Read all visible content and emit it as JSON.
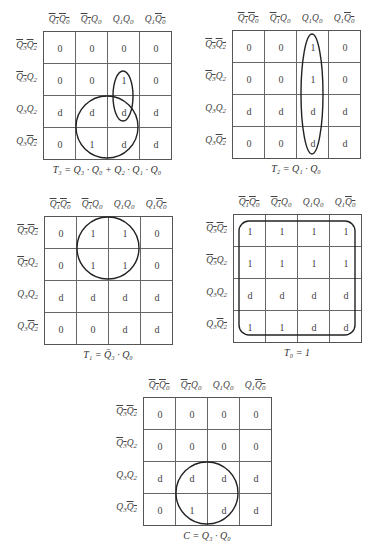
{
  "column_headers": [
    {
      "parts": [
        {
          "t": "Q",
          "sub": "1",
          "bar": true
        },
        {
          "t": "Q",
          "sub": "0",
          "bar": true
        }
      ]
    },
    {
      "parts": [
        {
          "t": "Q",
          "sub": "1",
          "bar": true
        },
        {
          "t": "Q",
          "sub": "0",
          "bar": false
        }
      ]
    },
    {
      "parts": [
        {
          "t": "Q",
          "sub": "1",
          "bar": false
        },
        {
          "t": "Q",
          "sub": "0",
          "bar": false
        }
      ]
    },
    {
      "parts": [
        {
          "t": "Q",
          "sub": "1",
          "bar": false
        },
        {
          "t": "Q",
          "sub": "0",
          "bar": true
        }
      ]
    }
  ],
  "row_headers": [
    {
      "parts": [
        {
          "t": "Q",
          "sub": "3",
          "bar": true
        },
        {
          "t": "Q",
          "sub": "2",
          "bar": true
        }
      ]
    },
    {
      "parts": [
        {
          "t": "Q",
          "sub": "3",
          "bar": true
        },
        {
          "t": "Q",
          "sub": "2",
          "bar": false
        }
      ]
    },
    {
      "parts": [
        {
          "t": "Q",
          "sub": "3",
          "bar": false
        },
        {
          "t": "Q",
          "sub": "2",
          "bar": false
        }
      ]
    },
    {
      "parts": [
        {
          "t": "Q",
          "sub": "3",
          "bar": false
        },
        {
          "t": "Q",
          "sub": "2",
          "bar": true
        }
      ]
    }
  ],
  "maps": [
    {
      "id": "T3",
      "caption": "T₃ = Q₃ · Q₀ + Q₂ · Q₁ · Q₀",
      "origin": [
        43,
        31
      ],
      "cells": [
        [
          "0",
          "0",
          "0",
          "0"
        ],
        [
          "0",
          "0",
          "1",
          "0"
        ],
        [
          "d",
          "d",
          "d",
          "d"
        ],
        [
          "0",
          "1",
          "d",
          "d"
        ]
      ],
      "groups": [
        {
          "shape": "ellipse",
          "cx": 80,
          "cy": 65,
          "rx": 10,
          "ry": 25
        },
        {
          "shape": "circle",
          "cx": 64,
          "cy": 96,
          "r": 31
        }
      ]
    },
    {
      "id": "T2",
      "caption": "T₂ = Q₁ · Q₀",
      "origin": [
        232,
        30
      ],
      "cells": [
        [
          "0",
          "0",
          "1",
          "0"
        ],
        [
          "0",
          "0",
          "1",
          "0"
        ],
        [
          "d",
          "d",
          "d",
          "d"
        ],
        [
          "0",
          "0",
          "d",
          "d"
        ]
      ],
      "groups": [
        {
          "shape": "ellipse",
          "cx": 80,
          "cy": 64,
          "rx": 11,
          "ry": 60
        }
      ]
    },
    {
      "id": "T1",
      "caption": "T₁ = Q̄₃ · Q₀",
      "origin": [
        44,
        216
      ],
      "cells": [
        [
          "0",
          "1",
          "1",
          "0"
        ],
        [
          "0",
          "1",
          "1",
          "0"
        ],
        [
          "d",
          "d",
          "d",
          "d"
        ],
        [
          "0",
          "0",
          "d",
          "d"
        ]
      ],
      "groups": [
        {
          "shape": "circle",
          "cx": 64,
          "cy": 32,
          "r": 31
        }
      ]
    },
    {
      "id": "T0",
      "caption": "T₀ = 1",
      "origin": [
        233,
        214
      ],
      "cells": [
        [
          "1",
          "1",
          "1",
          "1"
        ],
        [
          "1",
          "1",
          "1",
          "1"
        ],
        [
          "d",
          "d",
          "d",
          "d"
        ],
        [
          "1",
          "1",
          "d",
          "d"
        ]
      ],
      "groups": [
        {
          "shape": "roundrect",
          "x": 6,
          "y": 7,
          "w": 116,
          "h": 114,
          "r": 10
        }
      ]
    },
    {
      "id": "C",
      "caption": "C = Q₃ · Q₀",
      "origin": [
        143,
        397
      ],
      "cells": [
        [
          "0",
          "0",
          "0",
          "0"
        ],
        [
          "0",
          "0",
          "0",
          "0"
        ],
        [
          "d",
          "d",
          "d",
          "d"
        ],
        [
          "0",
          "1",
          "d",
          "d"
        ]
      ],
      "groups": [
        {
          "shape": "circle",
          "cx": 64,
          "cy": 96,
          "r": 31
        }
      ]
    }
  ]
}
